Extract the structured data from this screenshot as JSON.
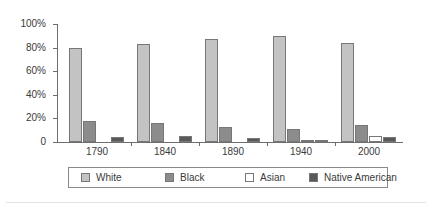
{
  "chart_data": {
    "type": "bar",
    "title": "",
    "subtitle": "",
    "xlabel": "",
    "ylabel": "",
    "categories": [
      "1790",
      "1840",
      "1890",
      "1940",
      "2000"
    ],
    "series": [
      {
        "name": "White",
        "color": "#c3c3c3",
        "values": [
          80,
          83,
          87,
          90,
          84
        ]
      },
      {
        "name": "Black",
        "color": "#8c8c8c",
        "values": [
          18,
          16,
          13,
          11,
          14
        ]
      },
      {
        "name": "Asian",
        "color": "#ffffff",
        "values": [
          0,
          0,
          0,
          2,
          5
        ]
      },
      {
        "name": "Native American",
        "color": "#595959",
        "values": [
          4,
          5,
          3,
          1,
          4
        ]
      }
    ],
    "ylim": [
      0,
      100
    ],
    "yticks": [
      0,
      20,
      40,
      60,
      80,
      100
    ],
    "ytick_labels": [
      "0",
      "20%",
      "40%",
      "60%",
      "80%",
      "100%"
    ],
    "grid": false,
    "legend_position": "bottom",
    "legend": [
      "White",
      "Black",
      "Asian",
      "Native American"
    ]
  },
  "axis": {
    "y_labels": [
      "100%",
      "80%",
      "60%",
      "40%",
      "20%",
      "0"
    ],
    "x_labels": [
      "1790",
      "1840",
      "1890",
      "1940",
      "2000"
    ]
  },
  "legend": {
    "items": [
      {
        "label": "White",
        "swatch": "white-swatch-icon"
      },
      {
        "label": "Black",
        "swatch": "black-swatch-icon"
      },
      {
        "label": "Asian",
        "swatch": "asian-swatch-icon"
      },
      {
        "label": "Native American",
        "swatch": "native-american-swatch-icon"
      }
    ]
  },
  "colors": {
    "white": "#c3c3c3",
    "black": "#8c8c8c",
    "asian": "#ffffff",
    "native": "#595959",
    "axis": "#6e6e6e",
    "text": "#3a3a3a"
  }
}
